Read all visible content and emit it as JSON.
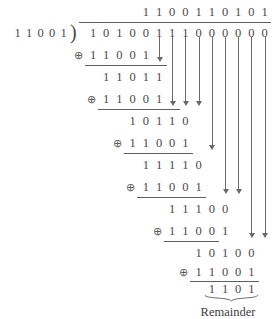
{
  "figure": {
    "type": "binary-long-division",
    "operation_symbol": "⊕",
    "divider_bracket": ")",
    "remainder_label": "Remainder",
    "ink_color": "#4a4a4a",
    "rule_color": "#5e5e5e",
    "background": "#ffffff"
  },
  "chart_data": {
    "type": "table",
    "divisor": "11001",
    "dividend": "10100111000000",
    "quotient": "1100110101",
    "remainder": "1101",
    "operator": "⊕",
    "steps": [
      {
        "minuend": "10100",
        "subtrahend": "11001",
        "result": "1101"
      },
      {
        "minuend": "11011",
        "subtrahend": "11001",
        "result": "0010"
      },
      {
        "minuend": "10110",
        "subtrahend": "11001",
        "result": "1111"
      },
      {
        "minuend": "11110",
        "subtrahend": "11001",
        "result": "0111"
      },
      {
        "minuend": "11100",
        "subtrahend": "11001",
        "result": "0101"
      },
      {
        "minuend": "10100",
        "subtrahend": "11001",
        "result": "1101"
      }
    ]
  },
  "rows": {
    "quotient": {
      "digits": [
        "1",
        "1",
        "0",
        "0",
        "1",
        "1",
        "0",
        "1",
        "0",
        "1"
      ],
      "start_col": 4
    },
    "dividend": {
      "digits": [
        "1",
        "0",
        "1",
        "0",
        "0",
        "1",
        "1",
        "1",
        "0",
        "0",
        "0",
        "0",
        "0",
        "0"
      ],
      "start_col": 0
    },
    "divisor": {
      "digits": [
        "1",
        "1",
        "0",
        "0",
        "1"
      ]
    },
    "sub1": {
      "digits": [
        "1",
        "1",
        "0",
        "0",
        "1"
      ],
      "start_col": 0
    },
    "part1": {
      "digits": [
        "1",
        "1",
        "0",
        "1",
        "1"
      ],
      "start_col": 1
    },
    "sub2": {
      "digits": [
        "1",
        "1",
        "0",
        "0",
        "1"
      ],
      "start_col": 1
    },
    "part2": {
      "digits": [
        "1",
        "0",
        "1",
        "1",
        "0"
      ],
      "start_col": 3
    },
    "sub3": {
      "digits": [
        "1",
        "1",
        "0",
        "0",
        "1"
      ],
      "start_col": 3
    },
    "part3": {
      "digits": [
        "1",
        "1",
        "1",
        "1",
        "0"
      ],
      "start_col": 4
    },
    "sub4": {
      "digits": [
        "1",
        "1",
        "0",
        "0",
        "1"
      ],
      "start_col": 4
    },
    "part4": {
      "digits": [
        "1",
        "1",
        "1",
        "0",
        "0"
      ],
      "start_col": 6
    },
    "sub5": {
      "digits": [
        "1",
        "1",
        "0",
        "0",
        "1"
      ],
      "start_col": 6
    },
    "part5": {
      "digits": [
        "1",
        "0",
        "1",
        "0",
        "0"
      ],
      "start_col": 8
    },
    "sub6": {
      "digits": [
        "1",
        "1",
        "0",
        "0",
        "1"
      ],
      "start_col": 8
    },
    "remainder": {
      "digits": [
        "1",
        "1",
        "0",
        "1"
      ],
      "start_col": 9
    }
  }
}
